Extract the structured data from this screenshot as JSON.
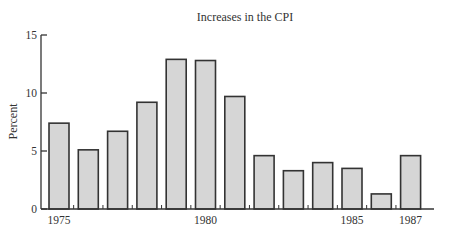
{
  "chart_data": {
    "type": "bar",
    "title": "Increases in the CPI",
    "xlabel": "",
    "ylabel": "Percent",
    "ylim": [
      0,
      15
    ],
    "yticks": [
      0,
      5,
      10,
      15
    ],
    "categories": [
      "1975",
      "1976",
      "1977",
      "1978",
      "1979",
      "1980",
      "1981",
      "1982",
      "1983",
      "1984",
      "1985",
      "1986",
      "1987"
    ],
    "xtick_labels": {
      "1975": "1975",
      "1980": "1980",
      "1985": "1985",
      "1987": "1987"
    },
    "values": [
      7.4,
      5.1,
      6.7,
      9.2,
      12.9,
      12.8,
      9.7,
      4.6,
      3.3,
      4.0,
      3.5,
      1.3,
      4.6
    ],
    "grid": false,
    "legend": null,
    "colors": {
      "bar_fill": "#d6d6d6",
      "bar_edge": "#333333",
      "axis": "#333333"
    }
  }
}
